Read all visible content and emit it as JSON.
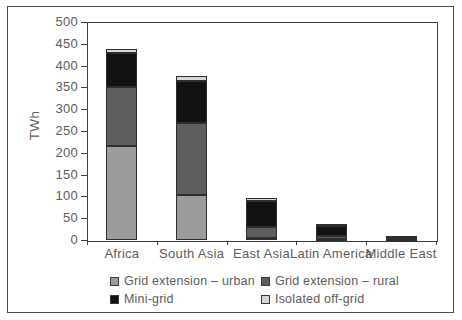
{
  "figure": {
    "background": "#ffffff",
    "border_color": "#4a4a4a",
    "text_color": "#5c5c5c"
  },
  "chart_data": {
    "type": "bar",
    "stacked": true,
    "title": "",
    "xlabel": "",
    "ylabel": "TWh",
    "ylim": [
      0,
      500
    ],
    "ytick_step": 50,
    "grid": false,
    "legend_position": "bottom",
    "categories": [
      "Africa",
      "South Asia",
      "East Asia",
      "Latin America",
      "Middle East"
    ],
    "series": [
      {
        "name": "Grid extension – urban",
        "color": "#9c9c9c",
        "values": [
          215,
          103,
          4,
          2,
          1
        ]
      },
      {
        "name": "Grid extension – rural",
        "color": "#5e5e5e",
        "values": [
          135,
          165,
          25,
          8,
          3
        ]
      },
      {
        "name": "Mini-grid",
        "color": "#121212",
        "values": [
          78,
          97,
          60,
          21,
          5
        ]
      },
      {
        "name": "Isolated off-grid",
        "color": "#d6d6d6",
        "values": [
          9,
          12,
          8,
          6,
          1
        ]
      }
    ]
  }
}
